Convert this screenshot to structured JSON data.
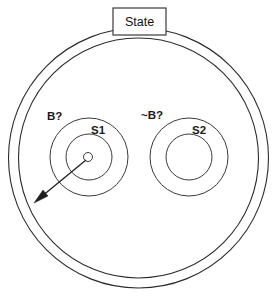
{
  "diagram": {
    "title_box": {
      "label": "State",
      "x": 113,
      "y": 8,
      "width": 53,
      "height": 27
    },
    "outer_shell": {
      "name": "state-boundary",
      "center_x": 138.5,
      "center_y": 158,
      "outer_radius": 130,
      "inner_radius": 120
    },
    "substates": [
      {
        "id": "left-substate",
        "outer_label": "B?",
        "inner_label": "S1",
        "center_x": 89,
        "center_y": 157,
        "outer_radius": 39,
        "inner_radius": 23,
        "outer_label_x": 47,
        "outer_label_y": 117,
        "inner_label_x": 91,
        "inner_label_y": 131,
        "has_initial_marker": true,
        "marker_radius": 4.5
      },
      {
        "id": "right-substate",
        "outer_label": "~B?",
        "inner_label": "S2",
        "center_x": 189,
        "center_y": 157,
        "outer_radius": 39,
        "inner_radius": 23,
        "outer_label_x": 141,
        "outer_label_y": 116,
        "inner_label_x": 192,
        "inner_label_y": 131,
        "has_initial_marker": false,
        "marker_radius": 0
      }
    ],
    "transition_arrow": {
      "name": "exit-transition",
      "from_x": 86,
      "from_y": 160,
      "to_x": 34,
      "to_y": 203
    },
    "colors": {
      "stroke": "#2b2b2b",
      "arrow": "#1f1f1f",
      "text": "#1a1a1a",
      "background": "#ffffff"
    }
  }
}
